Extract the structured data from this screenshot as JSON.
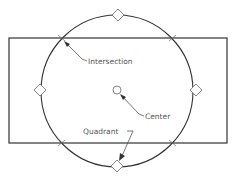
{
  "diagram": {
    "type": "cad-object-snap-illustration",
    "colors": {
      "line": "#333333",
      "marker": "#777777",
      "label": "#555555",
      "background": "#ffffff"
    },
    "rectangle": {
      "x": 9,
      "y": 38,
      "width": 218,
      "height": 105
    },
    "circle": {
      "cx": 117,
      "cy": 91,
      "r": 76
    },
    "center_marker": {
      "cx": 117,
      "cy": 90,
      "r": 4
    },
    "quadrant_markers": [
      {
        "cx": 118,
        "cy": 15
      },
      {
        "cx": 40,
        "cy": 90
      },
      {
        "cx": 196,
        "cy": 90
      },
      {
        "cx": 117,
        "cy": 166
      }
    ],
    "intersection_points": [
      {
        "x": 62,
        "y": 38
      },
      {
        "x": 173,
        "y": 38
      },
      {
        "x": 62,
        "y": 143
      },
      {
        "x": 173,
        "y": 143
      }
    ],
    "labels": {
      "intersection": "Intersection",
      "center": "Center",
      "quadrant": "Quadrant"
    }
  }
}
